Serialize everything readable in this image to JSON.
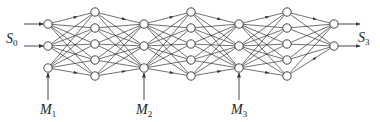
{
  "diagram": {
    "type": "chained multilayer neural network",
    "colors": {
      "line": "#333333",
      "node_fill": "#ffffff",
      "node_stroke": "#333333",
      "background": "#ffffff"
    },
    "node_radius": 4.2,
    "layers": [
      {
        "id": "in1",
        "x": 48,
        "ys": [
          24,
          46,
          68
        ]
      },
      {
        "id": "h1",
        "x": 95,
        "ys": [
          12,
          28,
          44,
          60,
          76
        ]
      },
      {
        "id": "in2",
        "x": 144,
        "ys": [
          24,
          46,
          68
        ]
      },
      {
        "id": "h2",
        "x": 191,
        "ys": [
          12,
          28,
          44,
          60,
          76
        ]
      },
      {
        "id": "in3",
        "x": 239,
        "ys": [
          24,
          46,
          68
        ]
      },
      {
        "id": "h3",
        "x": 287,
        "ys": [
          12,
          28,
          44,
          60,
          76
        ]
      },
      {
        "id": "out",
        "x": 334,
        "ys": [
          24,
          46
        ]
      }
    ],
    "connections": [
      [
        "in1",
        "h1"
      ],
      [
        "h1",
        "in2"
      ],
      [
        "in2",
        "h2"
      ],
      [
        "h2",
        "in3"
      ],
      [
        "in3",
        "h3"
      ],
      [
        "h3",
        "out"
      ]
    ],
    "inputs": {
      "from_x": 24,
      "ys": [
        24,
        46
      ]
    },
    "outputs": {
      "to_x": 360,
      "ys": [
        24,
        46
      ]
    },
    "m_arrows": [
      {
        "x": 48,
        "y1": 100,
        "y2": 73
      },
      {
        "x": 144,
        "y1": 100,
        "y2": 73
      },
      {
        "x": 239,
        "y1": 100,
        "y2": 73
      }
    ]
  },
  "labels": {
    "s0": {
      "main": "S",
      "sub": "0"
    },
    "s3": {
      "main": "S",
      "sub": "3"
    },
    "m1": {
      "main": "M",
      "sub": "1"
    },
    "m2": {
      "main": "M",
      "sub": "2"
    },
    "m3": {
      "main": "M",
      "sub": "3"
    }
  }
}
